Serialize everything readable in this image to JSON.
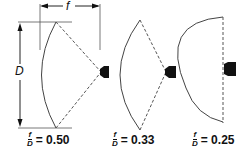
{
  "diagram": {
    "dimension_labels": {
      "focal_length": "f",
      "diameter": "D"
    },
    "colors": {
      "line": "#333333",
      "feed": "#111111",
      "background": "#ffffff"
    },
    "dishes": [
      {
        "id": "dish-1",
        "ratio_num": "f",
        "ratio_den": "D",
        "equals": "= 0.50",
        "value": 0.5
      },
      {
        "id": "dish-2",
        "ratio_num": "f",
        "ratio_den": "D",
        "equals": "= 0.33",
        "value": 0.33
      },
      {
        "id": "dish-3",
        "ratio_num": "f",
        "ratio_den": "D",
        "equals": "= 0.25",
        "value": 0.25
      }
    ]
  }
}
